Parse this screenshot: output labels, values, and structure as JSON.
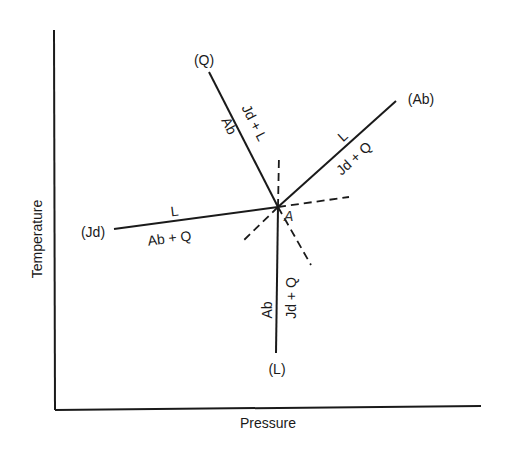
{
  "diagram": {
    "type": "phase-diagram",
    "axes": {
      "x_label": "Pressure",
      "y_label": "Temperature"
    },
    "invariant_point": {
      "label": "A",
      "x": 278,
      "y": 207
    },
    "univariant_curves": [
      {
        "id": "Q",
        "end_label": "(Q)",
        "side_a": "Jd + L",
        "side_b": "Ab"
      },
      {
        "id": "Ab",
        "end_label": "(Ab)",
        "side_a": "L",
        "side_b": "Jd + Q"
      },
      {
        "id": "Jd",
        "end_label": "(Jd)",
        "side_a": "L",
        "side_b": "Ab + Q"
      },
      {
        "id": "L",
        "end_label": "(L)",
        "side_a": "Ab",
        "side_b": "Jd + Q"
      }
    ],
    "metastable_extensions": 4,
    "colors": {
      "line": "#1a1a1a",
      "background": "#ffffff"
    }
  }
}
